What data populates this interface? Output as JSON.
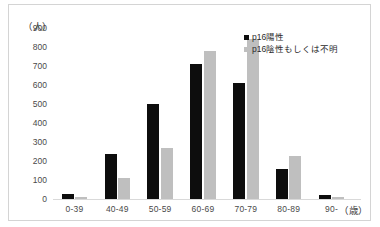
{
  "chart_data": {
    "type": "bar",
    "title": "",
    "subtitle": "",
    "xlabel": "（歳）",
    "ylabel": "（人）",
    "categories": [
      "0-39",
      "40-49",
      "50-59",
      "60-69",
      "70-79",
      "80-89",
      "90-"
    ],
    "series": [
      {
        "name": "p16陽性",
        "color": "#0d0d0d",
        "values": [
          25,
          235,
          500,
          710,
          610,
          160,
          20
        ]
      },
      {
        "name": "p16陰性もしくは不明",
        "color": "#bfbfbf",
        "values": [
          12,
          110,
          270,
          780,
          840,
          225,
          10
        ]
      }
    ],
    "ylim": [
      0,
      900
    ],
    "y_ticks": [
      900,
      800,
      700,
      600,
      500,
      400,
      300,
      200,
      100,
      0
    ],
    "grid": false,
    "legend_position": "top-right"
  },
  "axes": {
    "y_unit": "（人）",
    "x_unit": "（歳）"
  },
  "legend": {
    "items": [
      {
        "label": "p16陽性",
        "marker": "square-black"
      },
      {
        "label": "p16陰性もしくは不明",
        "marker": "square-gray"
      }
    ]
  }
}
